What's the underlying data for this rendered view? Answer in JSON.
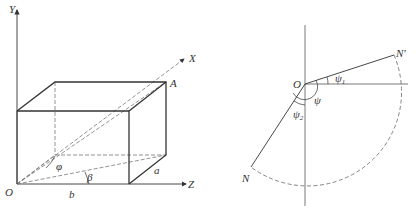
{
  "figure_left": {
    "title": "rectangular box in 3D coordinate system",
    "labels": {
      "y_axis": "Y",
      "x_axis": "X",
      "z_axis": "Z",
      "origin": "O",
      "point_a": "A",
      "edge_a": "a",
      "edge_b": "b",
      "angle_phi": "φ",
      "angle_beta": "β"
    }
  },
  "figure_right": {
    "title": "angle diagram",
    "labels": {
      "origin": "O",
      "point_n_prime": "N'",
      "point_n": "N",
      "angle_psi": "ψ",
      "angle_psi1_main": "ψ",
      "angle_psi1_sub": "1",
      "angle_psi2_main": "ψ",
      "angle_psi2_sub": "2"
    }
  },
  "colors": {
    "line": "#333333",
    "dash": "#666666"
  }
}
